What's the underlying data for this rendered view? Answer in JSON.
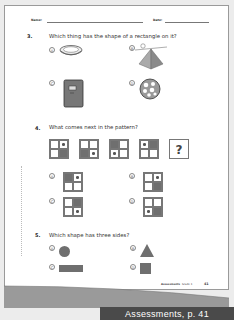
{
  "header": {
    "name_label": "Name:",
    "date_label": "Date:"
  },
  "questions": [
    {
      "number": "3.",
      "text": "Which thing has the shape of a rectangle on it?",
      "options": [
        {
          "letter": "A",
          "image": "pie-dish-icon"
        },
        {
          "letter": "B",
          "image": "pyramid-icon"
        },
        {
          "letter": "C",
          "image": "book-icon"
        },
        {
          "letter": "D",
          "image": "ball-icon"
        }
      ]
    },
    {
      "number": "4.",
      "text": "What comes next in the pattern?",
      "pattern": [
        [
          "empty",
          "dot",
          "empty",
          "filled"
        ],
        [
          "empty",
          "empty",
          "filled",
          "dot"
        ],
        [
          "filled",
          "empty",
          "dot",
          "empty"
        ],
        [
          "dot",
          "filled",
          "empty",
          "empty"
        ]
      ],
      "unknown_symbol": "?",
      "options": [
        {
          "letter": "A",
          "cells": [
            "filled",
            "dot",
            "empty",
            "empty"
          ]
        },
        {
          "letter": "B",
          "cells": [
            "empty",
            "dot",
            "empty",
            "filled"
          ]
        },
        {
          "letter": "C",
          "cells": [
            "empty",
            "filled",
            "empty",
            "dot"
          ]
        },
        {
          "letter": "D",
          "cells": [
            "empty",
            "empty",
            "dot",
            "filled"
          ]
        }
      ]
    },
    {
      "number": "5.",
      "text": "Which shape has three sides?",
      "options": [
        {
          "letter": "A",
          "shape": "circle"
        },
        {
          "letter": "B",
          "shape": "triangle"
        },
        {
          "letter": "C",
          "shape": "rectangle"
        },
        {
          "letter": "D",
          "shape": "square"
        }
      ]
    }
  ],
  "footer": {
    "section": "Assessments",
    "grade": "Grade 1",
    "page_number": "41"
  },
  "banner": {
    "label": "Assessments, p. 41"
  },
  "colors": {
    "shape_fill": "#6f6f6f",
    "banner_bg": "#4a4a4a",
    "page_bg": "#ffffff",
    "outer_bg": "#ececec"
  }
}
